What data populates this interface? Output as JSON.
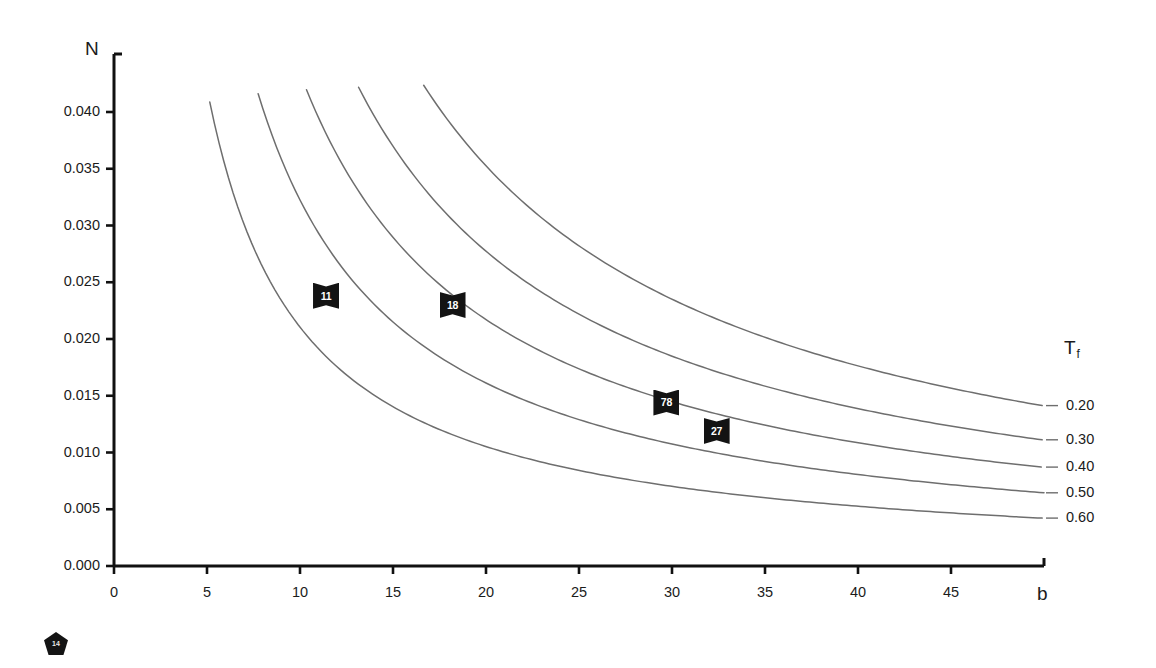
{
  "chart_data": {
    "type": "line",
    "title": "",
    "xlabel": "b",
    "ylabel": "N",
    "xlim": [
      0,
      50
    ],
    "ylim": [
      0.0,
      0.0425
    ],
    "grid": false,
    "legend_position": "right",
    "legend_title": "T",
    "legend_title_sub": "f",
    "xticks": [
      "0",
      "5",
      "10",
      "15",
      "20",
      "25",
      "30",
      "35",
      "40",
      "45"
    ],
    "xtick_values": [
      0,
      5,
      10,
      15,
      20,
      25,
      30,
      35,
      40,
      45
    ],
    "yticks": [
      "0.000",
      "0.005",
      "0.010",
      "0.015",
      "0.020",
      "0.025",
      "0.030",
      "0.035",
      "0.040"
    ],
    "ytick_values": [
      0.0,
      0.005,
      0.01,
      0.015,
      0.02,
      0.025,
      0.03,
      0.035,
      0.04
    ],
    "line_color": "#6e6e6e",
    "marker_color": "#131313",
    "series": [
      {
        "name": "0.60",
        "k": 0.2105,
        "x_start": 4.9,
        "x_end": 50.0,
        "points_x": [
          4.9,
          6,
          8,
          10,
          12,
          15,
          18,
          22,
          26,
          30,
          35,
          40,
          45,
          50
        ],
        "points_y": [
          0.043,
          0.0351,
          0.0263,
          0.0211,
          0.0175,
          0.014,
          0.0117,
          0.0096,
          0.0081,
          0.007,
          0.006,
          0.0053,
          0.0047,
          0.0042
        ]
      },
      {
        "name": "0.50",
        "k": 0.3225,
        "x_start": 7.5,
        "x_end": 50.0,
        "points_x": [
          7.5,
          9,
          11,
          13,
          16,
          19,
          23,
          27,
          31,
          35,
          40,
          45,
          50
        ],
        "points_y": [
          0.043,
          0.0358,
          0.0293,
          0.0248,
          0.0202,
          0.017,
          0.014,
          0.0119,
          0.0104,
          0.0092,
          0.0081,
          0.0072,
          0.0065
        ]
      },
      {
        "name": "0.40",
        "k": 0.4343,
        "x_start": 10.1,
        "x_end": 50.0,
        "points_x": [
          10.1,
          12,
          14,
          17,
          20,
          24,
          28,
          32,
          36,
          41,
          45,
          50
        ],
        "points_y": [
          0.043,
          0.0362,
          0.031,
          0.0255,
          0.0217,
          0.0181,
          0.0155,
          0.0136,
          0.0121,
          0.0106,
          0.0097,
          0.0087
        ]
      },
      {
        "name": "0.30",
        "k": 0.5547,
        "x_start": 12.9,
        "x_end": 50.0,
        "points_x": [
          12.9,
          15,
          18,
          21,
          25,
          29,
          33,
          37,
          42,
          46,
          50
        ],
        "points_y": [
          0.043,
          0.037,
          0.0308,
          0.0264,
          0.0222,
          0.0191,
          0.0168,
          0.015,
          0.0132,
          0.0121,
          0.0111
        ]
      },
      {
        "name": "0.20",
        "k": 0.7052,
        "x_start": 16.4,
        "x_end": 50.0,
        "points_x": [
          16.4,
          19,
          22,
          26,
          30,
          34,
          38,
          43,
          47,
          50
        ],
        "points_y": [
          0.043,
          0.0371,
          0.0321,
          0.0271,
          0.0235,
          0.0207,
          0.0186,
          0.0164,
          0.015,
          0.0141
        ]
      }
    ],
    "data_markers": [
      {
        "label": "11",
        "x": 11.4,
        "y": 0.0238
      },
      {
        "label": "18",
        "x": 18.2,
        "y": 0.023
      },
      {
        "label": "78",
        "x": 29.7,
        "y": 0.0144
      },
      {
        "label": "27",
        "x": 32.4,
        "y": 0.0119
      }
    ],
    "corner_badge_label": "14"
  }
}
